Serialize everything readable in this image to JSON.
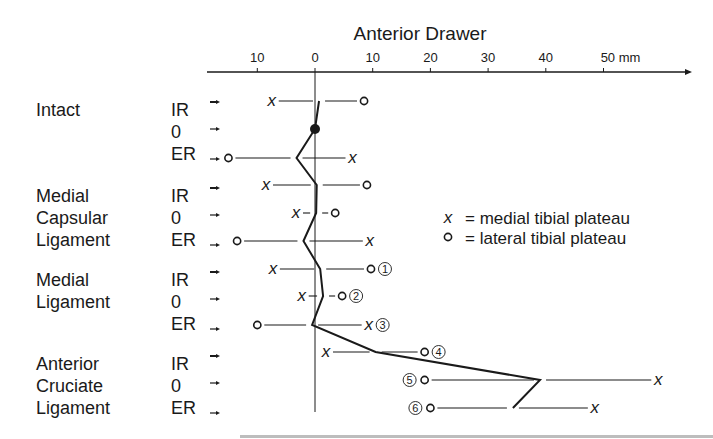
{
  "chart_data": {
    "type": "scatter",
    "title": "Anterior Drawer",
    "xlabel": "Anterior Drawer (mm)",
    "unit": "mm",
    "x_ticks": [
      {
        "label": "10",
        "value": -10
      },
      {
        "label": "0",
        "value": 0
      },
      {
        "label": "10",
        "value": 10
      },
      {
        "label": "20",
        "value": 20
      },
      {
        "label": "30",
        "value": 30
      },
      {
        "label": "40",
        "value": 40
      },
      {
        "label": "50 mm",
        "value": 50
      }
    ],
    "xlim": [
      -19,
      60
    ],
    "legend": [
      {
        "symbol": "x",
        "label": "= medial tibial plateau"
      },
      {
        "symbol": "o",
        "label": "= lateral tibial plateau"
      }
    ],
    "groups": [
      {
        "name": [
          "Intact"
        ],
        "rows": [
          {
            "rotation": "IR",
            "medial_x": -7.5,
            "lateral_o": 8.5,
            "center": 0.7,
            "annotation": ""
          },
          {
            "rotation": "0",
            "medial_x": null,
            "lateral_o": null,
            "center": 0,
            "annotation": "",
            "filled_dot": true
          },
          {
            "rotation": "ER",
            "medial_x": 6.5,
            "lateral_o": -15,
            "center": -3.2,
            "annotation": ""
          }
        ]
      },
      {
        "name": [
          "Medial",
          "Capsular",
          "Ligament"
        ],
        "rows": [
          {
            "rotation": "IR",
            "medial_x": -8.5,
            "lateral_o": 9,
            "center": 0.3,
            "annotation": ""
          },
          {
            "rotation": "0",
            "medial_x": -3.3,
            "lateral_o": 3.5,
            "center": 0.2,
            "annotation": ""
          },
          {
            "rotation": "ER",
            "medial_x": 9.5,
            "lateral_o": -13.5,
            "center": -2,
            "annotation": ""
          }
        ]
      },
      {
        "name": [
          "Medial",
          "Ligament"
        ],
        "rows": [
          {
            "rotation": "IR",
            "medial_x": -7.3,
            "lateral_o": 9.7,
            "center": 0.9,
            "annotation": "1"
          },
          {
            "rotation": "0",
            "medial_x": -2.3,
            "lateral_o": 4.7,
            "center": 1.4,
            "annotation": "2"
          },
          {
            "rotation": "ER",
            "medial_x": 9.3,
            "lateral_o": -10,
            "center": -0.5,
            "annotation": "3"
          }
        ]
      },
      {
        "name": [
          "Anterior",
          "Cruciate",
          "Ligament"
        ],
        "rows": [
          {
            "rotation": "IR",
            "medial_x": 1.9,
            "lateral_o": 19,
            "center": 10.5,
            "annotation": "4"
          },
          {
            "rotation": "0",
            "medial_x": 59.5,
            "lateral_o": 19,
            "center": 39,
            "annotation": "5"
          },
          {
            "rotation": "ER",
            "medial_x": 48.5,
            "lateral_o": 20,
            "center": 34.3,
            "annotation": "6"
          }
        ]
      }
    ],
    "grid": false,
    "legend_position": "right-middle"
  },
  "layout": {
    "zero_px": 315,
    "px_per_mm": 5.77,
    "axis_y": 72,
    "row_y": [
      101,
      129,
      158,
      185,
      213,
      241,
      269,
      296,
      325,
      352,
      380,
      408
    ],
    "row_label_y": [
      110,
      132,
      154,
      196,
      218,
      240,
      280,
      302,
      324,
      364,
      386,
      408
    ]
  }
}
